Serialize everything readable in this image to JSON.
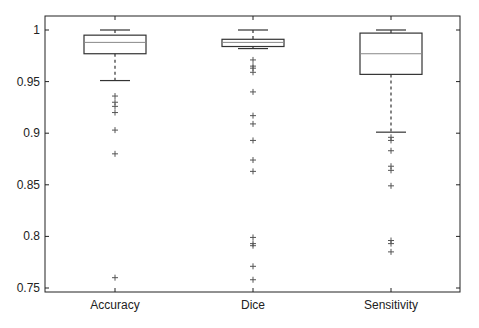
{
  "chart_data": {
    "type": "box",
    "title": "",
    "xlabel": "",
    "ylabel": "",
    "ylim": [
      0.745,
      1.02
    ],
    "yticks": [
      0.75,
      0.8,
      0.85,
      0.9,
      0.95,
      1
    ],
    "ytick_labels": [
      "0.75",
      "0.8",
      "0.85",
      "0.9",
      "0.95",
      "1"
    ],
    "grid": false,
    "legend": null,
    "categories": [
      "Accuracy",
      "Dice",
      "Sensitivity"
    ],
    "series": [
      {
        "name": "Accuracy",
        "whisker_high": 1.0,
        "q3": 0.995,
        "median": 0.988,
        "q1": 0.977,
        "whisker_low": 0.951,
        "outliers": [
          0.936,
          0.93,
          0.926,
          0.92,
          0.903,
          0.88,
          0.76
        ]
      },
      {
        "name": "Dice",
        "whisker_high": 1.0,
        "q3": 0.991,
        "median": 0.988,
        "q1": 0.984,
        "whisker_low": 0.982,
        "outliers": [
          0.971,
          0.965,
          0.963,
          0.959,
          0.94,
          0.917,
          0.909,
          0.893,
          0.874,
          0.863,
          0.799,
          0.793,
          0.791,
          0.771,
          0.758
        ]
      },
      {
        "name": "Sensitivity",
        "whisker_high": 1.0,
        "q3": 0.997,
        "median": 0.977,
        "q1": 0.957,
        "whisker_low": 0.901,
        "outliers": [
          0.896,
          0.893,
          0.883,
          0.868,
          0.864,
          0.849,
          0.796,
          0.793,
          0.785
        ]
      }
    ],
    "colors": {
      "box": "#333333",
      "median": "#777777",
      "outlier": "#555555",
      "axis": "#222222"
    }
  }
}
